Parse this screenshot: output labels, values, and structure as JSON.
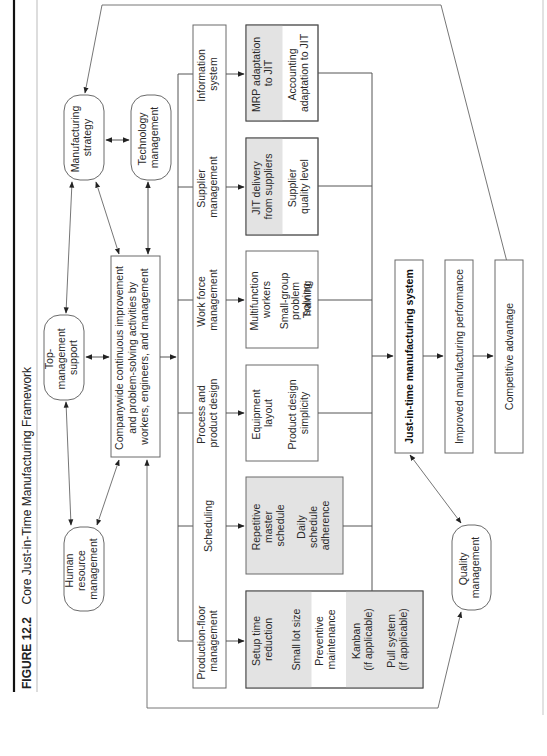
{
  "figure": {
    "number": "FIGURE 12.2",
    "title": "Core Just-in-Time Manufacturing Framework"
  },
  "support_nodes": {
    "manufacturing_strategy": [
      "Manufacturing",
      "strategy"
    ],
    "technology_management": [
      "Technology",
      "management"
    ],
    "top_management_support": [
      "Top-",
      "management",
      "support"
    ],
    "human_resource_management": [
      "Human",
      "resource",
      "management"
    ],
    "quality_management": [
      "Quality",
      "management"
    ]
  },
  "core_activity": {
    "lines": [
      "Companywide continuous improvement",
      "and problem-solving activities by",
      "workers, engineers, and management"
    ]
  },
  "functions": [
    {
      "id": "information_system",
      "label": [
        "Information",
        "system"
      ]
    },
    {
      "id": "supplier_management",
      "label": [
        "Supplier",
        "management"
      ]
    },
    {
      "id": "work_force_management",
      "label": [
        "Work force",
        "management"
      ]
    },
    {
      "id": "process_product_design",
      "label": [
        "Process and",
        "product design"
      ]
    },
    {
      "id": "scheduling",
      "label": [
        "Scheduling"
      ]
    },
    {
      "id": "production_floor_management",
      "label": [
        "Production-floor",
        "management"
      ]
    }
  ],
  "practices": {
    "information_system": [
      [
        "MRP adaptation",
        "to JIT"
      ],
      [
        "Accounting",
        "adaptation to JIT"
      ]
    ],
    "supplier_management": [
      [
        "JIT delivery",
        "from suppliers"
      ],
      [
        "Supplier",
        "quality level"
      ]
    ],
    "work_force_management": [
      [
        "Multifunction",
        "workers"
      ],
      [
        "Small-group",
        "problem",
        "solving"
      ],
      [
        "Training"
      ]
    ],
    "process_product_design": [
      [
        "Equipment",
        "layout"
      ],
      [
        "Product design",
        "simplicity"
      ]
    ],
    "scheduling": [
      [
        "Repetitive",
        "master",
        "schedule"
      ],
      [
        "Daily",
        "schedule",
        "adherence"
      ]
    ],
    "production_floor_management": [
      [
        "Setup time",
        "reduction"
      ],
      [
        "Small lot size"
      ],
      [
        "Preventive",
        "maintenance"
      ],
      [
        "Kanban",
        "(if applicable)"
      ],
      [
        "Pull system",
        "(if applicable)"
      ]
    ]
  },
  "outcomes": {
    "jit_system": "Just-in-time manufacturing system",
    "performance": "Improved manufacturing performance",
    "advantage": "Competitive advantage"
  },
  "colors": {
    "shaded_box": "#e3e3e3",
    "line": "#555555",
    "text": "#2a2a2a"
  }
}
